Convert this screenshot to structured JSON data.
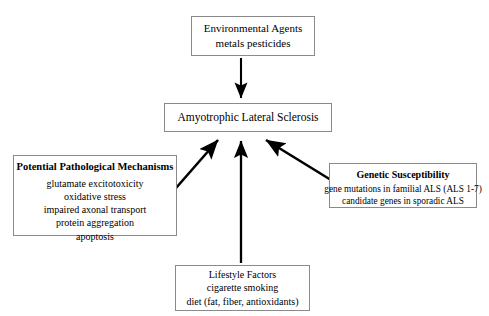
{
  "diagram": {
    "background_color": "#ffffff",
    "box_border_color": "#8a8a8a",
    "arrow_color": "#000000",
    "nodes": {
      "environmental": {
        "lines": [
          "Environmental Agents",
          "metals pesticides"
        ],
        "bold_header": false
      },
      "als": {
        "lines": [
          "Amyotrophic Lateral Sclerosis"
        ],
        "bold_header": false
      },
      "mechanisms": {
        "header": "Potential Pathological Mechanisms",
        "lines": [
          "glutamate excitotoxicity",
          "oxidative stress",
          "impaired axonal transport",
          "protein aggregation",
          "apoptosis"
        ],
        "bold_header": true
      },
      "genetic": {
        "header": "Genetic Susceptibility",
        "lines": [
          "gene mutations in familial ALS (ALS 1-7)",
          "candidate genes in sporadic ALS"
        ],
        "bold_header": true
      },
      "lifestyle": {
        "lines": [
          "Lifestyle Factors",
          "cigarette smoking",
          "diet (fat, fiber, antioxidants)"
        ],
        "bold_header": false
      }
    },
    "arrows": [
      {
        "name": "environmental-to-als",
        "direction": "down"
      },
      {
        "name": "mechanisms-to-als",
        "direction": "up-right"
      },
      {
        "name": "lifestyle-to-als",
        "direction": "up"
      },
      {
        "name": "genetic-to-als",
        "direction": "up-left"
      }
    ]
  }
}
